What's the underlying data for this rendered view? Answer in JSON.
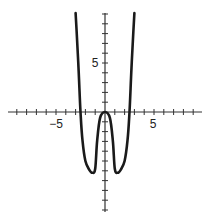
{
  "chart_data": {
    "type": "line",
    "title": "",
    "xlabel": "",
    "ylabel": "",
    "xlim": [
      -10,
      10
    ],
    "ylim": [
      -10,
      10
    ],
    "grid": false,
    "x_tick_step": 1,
    "y_tick_step": 1,
    "x_tick_labels": [
      {
        "value": -5,
        "text": "−5"
      },
      {
        "value": 5,
        "text": "5"
      }
    ],
    "y_tick_labels": [
      {
        "value": 5,
        "text": "5"
      }
    ],
    "series": [
      {
        "name": "f(x)",
        "description": "even quartic-like curve: local max 0 at x=0, minima about -6 at x = ±1.3, zeros at x = ±2.5",
        "points": [
          [
            -3.0,
            10.1
          ],
          [
            -2.9,
            8.3
          ],
          [
            -2.7,
            4.5
          ],
          [
            -2.5,
            0
          ],
          [
            -2.3,
            -2.9
          ],
          [
            -2.0,
            -5.0
          ],
          [
            -1.6,
            -5.9
          ],
          [
            -1.3,
            -6.2
          ],
          [
            -1.0,
            -5.8
          ],
          [
            -0.8,
            -2.9
          ],
          [
            -0.5,
            -0.6
          ],
          [
            0,
            0
          ],
          [
            0.5,
            -0.6
          ],
          [
            0.8,
            -2.9
          ],
          [
            1.0,
            -5.8
          ],
          [
            1.3,
            -6.2
          ],
          [
            1.6,
            -5.9
          ],
          [
            2.0,
            -5.0
          ],
          [
            2.3,
            -2.9
          ],
          [
            2.5,
            0
          ],
          [
            2.7,
            4.5
          ],
          [
            2.9,
            8.3
          ],
          [
            3.0,
            10.1
          ]
        ]
      }
    ]
  },
  "labels": {
    "x_neg5": "−5",
    "x_pos5": "5",
    "y_pos5": "5"
  }
}
